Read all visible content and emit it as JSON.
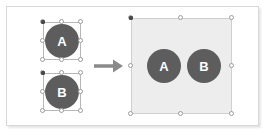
{
  "figure": {
    "background_color": "#ffffff",
    "border_color": "#d8d8d8"
  },
  "palette": {
    "shape_fill": "#5d5d5d",
    "shape_label_color": "#ffffff",
    "group_fill": "#ededed",
    "group_border": "#cfcfcf",
    "selection_border": "#b7b7b7",
    "handle_fill": "#ffffff",
    "handle_border": "#9b9b9b",
    "anchor_fill": "#4a4a4a",
    "arrow_color": "#8a8a8a"
  },
  "before": {
    "caption": "",
    "selections": [
      {
        "name": "selection-shape-a",
        "shape_label": "A",
        "state": "selected",
        "handle_count": 8,
        "has_anchor": true
      },
      {
        "name": "selection-shape-b",
        "shape_label": "B",
        "state": "selected",
        "handle_count": 8,
        "has_anchor": true
      }
    ]
  },
  "arrow": {
    "name": "transform-arrow",
    "direction": "right",
    "label": ""
  },
  "after": {
    "caption": "",
    "group": {
      "name": "grouped-selection",
      "state": "selected",
      "handle_count": 8,
      "has_anchor": true,
      "members": [
        {
          "shape_label": "A"
        },
        {
          "shape_label": "B"
        }
      ]
    }
  }
}
